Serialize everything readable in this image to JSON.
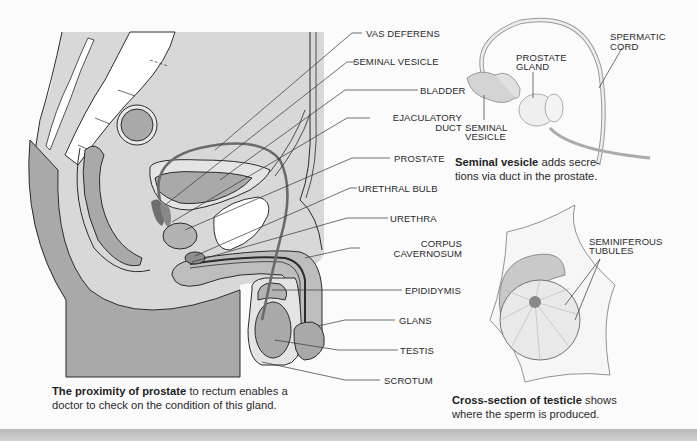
{
  "main_diagram": {
    "title": "Male pelvic sagittal section",
    "labels": [
      {
        "id": "vas-deferens",
        "text": "VAS DEFERENS"
      },
      {
        "id": "seminal-vesicle",
        "text": "SEMINAL VESICLE"
      },
      {
        "id": "bladder",
        "text": "BLADDER"
      },
      {
        "id": "ejaculatory-duct-1",
        "text": "EJACULATORY"
      },
      {
        "id": "ejaculatory-duct-2",
        "text": "DUCT"
      },
      {
        "id": "prostate",
        "text": "PROSTATE"
      },
      {
        "id": "urethral-bulb",
        "text": "URETHRAL BULB"
      },
      {
        "id": "urethra",
        "text": "URETHRA"
      },
      {
        "id": "corpus-cavernosum-1",
        "text": "CORPUS"
      },
      {
        "id": "corpus-cavernosum-2",
        "text": "CAVERNOSUM"
      },
      {
        "id": "epididymis",
        "text": "EPIDIDYMIS"
      },
      {
        "id": "glans",
        "text": "GLANS"
      },
      {
        "id": "testis",
        "text": "TESTIS"
      },
      {
        "id": "scrotum",
        "text": "SCROTUM"
      }
    ],
    "caption": {
      "bold": "The proximity of prostate",
      "line1": " to rectum enables a",
      "line2": "doctor to check on the condition of this gland."
    }
  },
  "seminal_vesicle_inset": {
    "labels": [
      {
        "id": "spermatic-cord-1",
        "text": "SPERMATIC"
      },
      {
        "id": "spermatic-cord-2",
        "text": "CORD"
      },
      {
        "id": "prostate-gland-1",
        "text": "PROSTATE"
      },
      {
        "id": "prostate-gland-2",
        "text": "GLAND"
      },
      {
        "id": "seminal-vesicle-1",
        "text": "SEMINAL"
      },
      {
        "id": "seminal-vesicle-2",
        "text": "VESICLE"
      }
    ],
    "caption": {
      "bold": "Seminal vesicle",
      "line1": "  adds secre-",
      "line2": "tions via duct in the prostate."
    }
  },
  "testicle_inset": {
    "labels": [
      {
        "id": "seminiferous-1",
        "text": "SEMINIFEROUS"
      },
      {
        "id": "seminiferous-2",
        "text": "TUBULES"
      }
    ],
    "caption": {
      "bold": "Cross-section of testicle",
      "line1": " shows",
      "line2": "where the sperm is produced."
    }
  },
  "colors": {
    "background": "#fbfbfb",
    "tissue_light": "#d9d9d9",
    "tissue_mid": "#bcbcbc",
    "tissue_dark": "#9c9c9c",
    "bone": "#ffffff",
    "outline": "#2b2b2b",
    "vas_deferens": "#6a6a6a"
  }
}
